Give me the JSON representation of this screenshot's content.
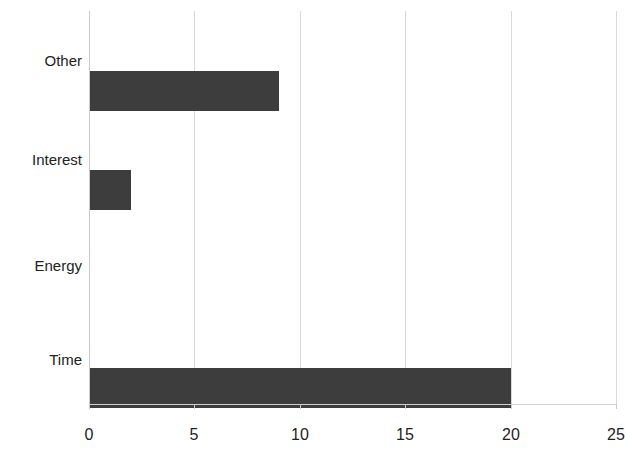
{
  "chart_data": {
    "type": "bar",
    "orientation": "horizontal",
    "title": "",
    "subtitle": "",
    "xlabel": "",
    "ylabel": "",
    "categories": [
      "Other",
      "Interest",
      "Energy",
      "Time"
    ],
    "values": [
      9,
      2,
      0,
      20
    ],
    "xlim": [
      0,
      25
    ],
    "xticks": [
      0,
      5,
      10,
      15,
      20,
      25
    ],
    "xtick_labels": [
      "0",
      "5",
      "10",
      "15",
      "20",
      "25"
    ],
    "grid": "vertical",
    "legend": "none",
    "annotations": [],
    "colors": {
      "bar": "#3d3d3d",
      "gridline": "#d9d9d9",
      "axis": "#c9c9c9",
      "text": "#222222",
      "background": "#ffffff"
    }
  }
}
